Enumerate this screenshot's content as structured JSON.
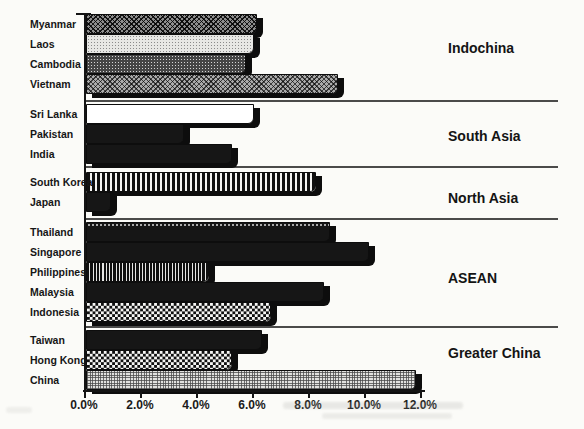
{
  "chart_data": {
    "type": "bar",
    "orientation": "horizontal",
    "value_unit": "percent",
    "xlim": [
      0,
      12
    ],
    "x_tick_labels": [
      "0.0%",
      "2.0%",
      "4.0%",
      "6.0%",
      "8.0%",
      "10.0%",
      "12.0%"
    ],
    "grid": false,
    "group_label_position": "right",
    "groups": [
      {
        "label": "Indochina",
        "bars": [
          {
            "country": "Myanmar",
            "value": 6.1,
            "pattern": "diagonal-crosshatch"
          },
          {
            "country": "Laos",
            "value": 6.0,
            "pattern": "light-stipple"
          },
          {
            "country": "Cambodia",
            "value": 5.7,
            "pattern": "dark-stipple"
          },
          {
            "country": "Vietnam",
            "value": 9.0,
            "pattern": "medium-crosshatch"
          }
        ]
      },
      {
        "label": "South Asia",
        "bars": [
          {
            "country": "Sri Lanka",
            "value": 6.0,
            "pattern": "white"
          },
          {
            "country": "Pakistan",
            "value": 3.5,
            "pattern": "solid-black"
          },
          {
            "country": "India",
            "value": 5.2,
            "pattern": "solid-black"
          }
        ]
      },
      {
        "label": "North Asia",
        "bars": [
          {
            "country": "South Korea",
            "value": 8.2,
            "pattern": "wide-vertical-stripes"
          },
          {
            "country": "Japan",
            "value": 0.9,
            "pattern": "solid-black"
          }
        ]
      },
      {
        "label": "ASEAN",
        "bars": [
          {
            "country": "Thailand",
            "value": 8.7,
            "pattern": "solid-black-dotted-top"
          },
          {
            "country": "Singapore",
            "value": 10.1,
            "pattern": "solid-black"
          },
          {
            "country": "Philippines",
            "value": 4.4,
            "pattern": "fine-vertical-stripes"
          },
          {
            "country": "Malaysia",
            "value": 8.5,
            "pattern": "solid-black"
          },
          {
            "country": "Indonesia",
            "value": 6.6,
            "pattern": "checkerboard"
          }
        ]
      },
      {
        "label": "Greater China",
        "bars": [
          {
            "country": "Taiwan",
            "value": 6.3,
            "pattern": "solid-black"
          },
          {
            "country": "Hong Kong",
            "value": 5.2,
            "pattern": "checkerboard"
          },
          {
            "country": "China",
            "value": 11.8,
            "pattern": "light-grid-stipple"
          }
        ]
      }
    ],
    "colors": {
      "ink": "#141414",
      "paper": "#fbfbf8"
    }
  }
}
